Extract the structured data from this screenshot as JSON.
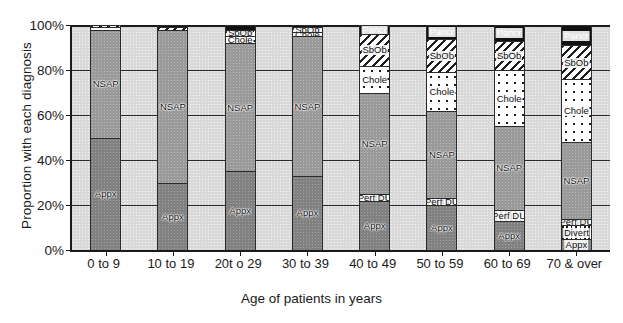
{
  "chart_data": {
    "type": "bar",
    "subtype": "stacked-100-percent",
    "title": "",
    "xlabel": "Age of patients in years",
    "ylabel": "Proportion with each diagnosis",
    "categories": [
      "0 to 9",
      "10 to 19",
      "20t o 29",
      "30 to 39",
      "40 to 49",
      "50 to 59",
      "60 to 69",
      "70 & over"
    ],
    "ytick_labels": [
      "100%",
      "80%",
      "60%",
      "40%",
      "20%",
      "0%"
    ],
    "ytick_values": [
      100,
      80,
      60,
      40,
      20,
      0
    ],
    "ylim": [
      0,
      100
    ],
    "grid": true,
    "legend": "inline-labels",
    "series": [
      {
        "name": "Appx",
        "label": "Appx",
        "fill": "appx",
        "values": [
          50,
          30,
          35,
          33,
          22,
          20,
          13,
          5
        ]
      },
      {
        "name": "Divert",
        "label": "Divert",
        "fill": "divert",
        "values": [
          0,
          0,
          0,
          0,
          0,
          0,
          0,
          6
        ]
      },
      {
        "name": "Perf DU",
        "label": "Perf DU",
        "fill": "perfdu",
        "values": [
          0,
          0,
          0,
          0,
          3,
          3,
          5,
          3
        ]
      },
      {
        "name": "NSAP",
        "label": "NSAP",
        "fill": "nsap",
        "values": [
          48,
          68,
          57,
          62,
          45,
          39,
          37,
          34
        ]
      },
      {
        "name": "Chole",
        "label": "Chole",
        "fill": "chole",
        "values": [
          1,
          0,
          3,
          2,
          12,
          17,
          25,
          28
        ]
      },
      {
        "name": "SbOb",
        "label": "SbOb",
        "fill": "sbob",
        "values": [
          1,
          1,
          3,
          2,
          14,
          15,
          13,
          15
        ]
      },
      {
        "name": "Pancr",
        "label": "Pancr",
        "fill": "pancr",
        "values": [
          0,
          1,
          2,
          1,
          4,
          6,
          7,
          9
        ]
      }
    ],
    "visible_segment_labels": {
      "0 to 9": [
        "Appx",
        "NSAP"
      ],
      "10 to 19": [
        "Appx",
        "NSAP"
      ],
      "20t o 29": [
        "Appx",
        "NSAP",
        "Chole",
        "SbOb"
      ],
      "30 to 39": [
        "Appx",
        "NSAP",
        "Chole",
        "SbOb"
      ],
      "40 to 49": [
        "Appx",
        "Perf DU",
        "NSAP",
        "Chole",
        "SbOb",
        "Pancr"
      ],
      "50 to 59": [
        "Appx",
        "Perf DU",
        "NSAP",
        "Chole",
        "SbOb",
        "Pancr"
      ],
      "60 to 69": [
        "Appx",
        "Perf DU",
        "NSAP",
        "Chole",
        "SbOb",
        "Pancr"
      ],
      "70 & over": [
        "Appx",
        "Divert",
        "Perf DU",
        "NSAP",
        "Chole",
        "SbOb",
        "Pancr"
      ]
    }
  }
}
